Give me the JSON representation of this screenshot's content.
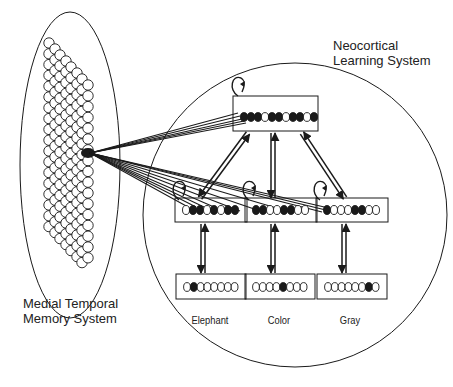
{
  "labels": {
    "neocortical": [
      "Neocortical",
      "Learning System"
    ],
    "medial": [
      "Medial Temporal",
      "Memory System"
    ]
  },
  "output_words": [
    "Elephant",
    "Color",
    "Gray"
  ],
  "layers": {
    "hidden_top": {
      "units": 11,
      "pattern": [
        1,
        1,
        1,
        0,
        1,
        1,
        0,
        1,
        1,
        0,
        1
      ]
    },
    "hidden_mid": [
      {
        "units": 8,
        "pattern": [
          0,
          1,
          1,
          0,
          1,
          0,
          1,
          1
        ]
      },
      {
        "units": 8,
        "pattern": [
          1,
          1,
          0,
          0,
          1,
          1,
          0,
          0
        ]
      },
      {
        "units": 8,
        "pattern": [
          1,
          0,
          0,
          0,
          1,
          1,
          0,
          0
        ]
      }
    ],
    "input": [
      {
        "units": 8,
        "active_index": 1
      },
      {
        "units": 8,
        "active_index": 4
      },
      {
        "units": 8,
        "active_index": 6
      }
    ]
  },
  "colors": {
    "line": "#1a1a1a",
    "background": "#ffffff"
  }
}
